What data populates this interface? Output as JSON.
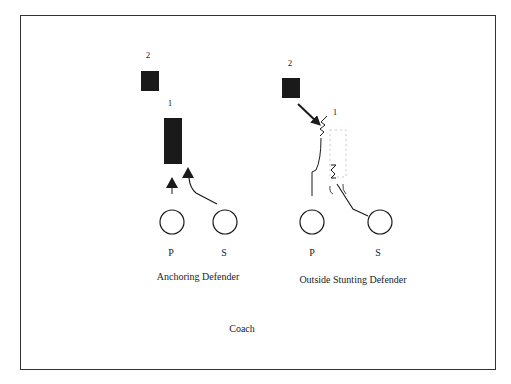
{
  "diagrams": [
    {
      "id": "left",
      "caption": "Anchoring Defender",
      "players": {
        "defender_2": {
          "label": "2"
        },
        "defender_1": {
          "label": "1"
        },
        "blocker_p": {
          "label": "P"
        },
        "blocker_s": {
          "label": "S"
        }
      }
    },
    {
      "id": "right",
      "caption": "Outside Stunting Defender",
      "players": {
        "defender_2": {
          "label": "2"
        },
        "defender_1": {
          "label": "1"
        },
        "blocker_p": {
          "label": "P"
        },
        "blocker_s": {
          "label": "S"
        }
      }
    }
  ],
  "footer": {
    "label": "Coach"
  },
  "colors": {
    "ink": "#1a1a1a",
    "frame": "#333333",
    "ghost": "#bbbbbb",
    "background": "#ffffff"
  }
}
